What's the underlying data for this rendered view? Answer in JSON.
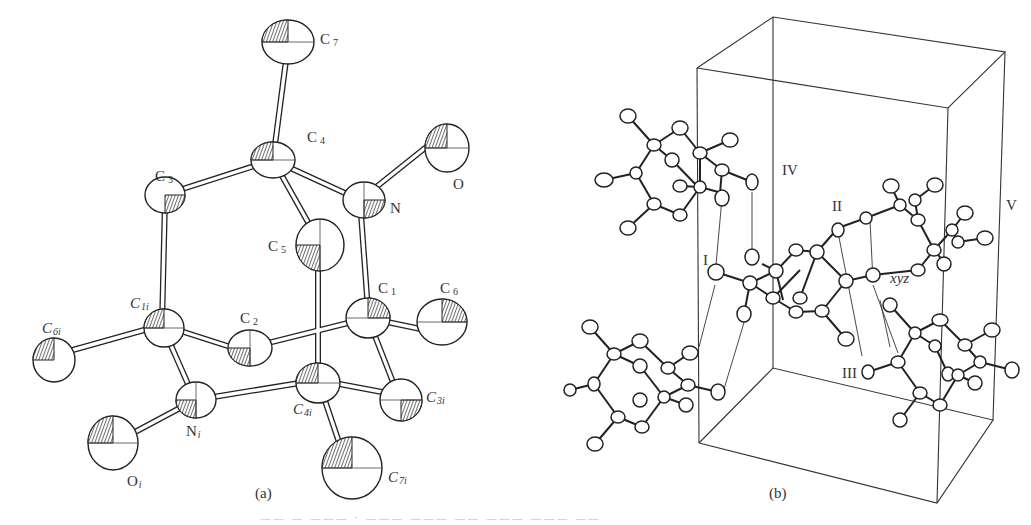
{
  "figure": {
    "panel_a": {
      "label": "(a)",
      "atoms": [
        {
          "id": "C7",
          "text": "C",
          "sub": "7",
          "italic": false
        },
        {
          "id": "C4",
          "text": "C",
          "sub": "4",
          "italic": false
        },
        {
          "id": "C3",
          "text": "C",
          "sub": "3",
          "italic": false
        },
        {
          "id": "N",
          "text": "N",
          "sub": "",
          "italic": false
        },
        {
          "id": "O",
          "text": "O",
          "sub": "",
          "italic": false
        },
        {
          "id": "C5",
          "text": "C",
          "sub": "5",
          "italic": false
        },
        {
          "id": "C1i",
          "text": "C",
          "sub": "1i",
          "italic": true
        },
        {
          "id": "C2",
          "text": "C",
          "sub": "2",
          "italic": false
        },
        {
          "id": "C1",
          "text": "C",
          "sub": "1",
          "italic": false
        },
        {
          "id": "C6",
          "text": "C",
          "sub": "6",
          "italic": false
        },
        {
          "id": "C6i",
          "text": "C",
          "sub": "6i",
          "italic": true
        },
        {
          "id": "Ni",
          "text": "N",
          "sub": "i",
          "italic": false
        },
        {
          "id": "C4i",
          "text": "C",
          "sub": "4i",
          "italic": true
        },
        {
          "id": "C3i",
          "text": "C",
          "sub": "3i",
          "italic": true
        },
        {
          "id": "Oi",
          "text": "O",
          "sub": "i",
          "italic": false
        },
        {
          "id": "C7i",
          "text": "C",
          "sub": "7i",
          "italic": true
        }
      ]
    },
    "panel_b": {
      "label": "(b)",
      "molecule_labels": [
        "I",
        "II",
        "III",
        "IV",
        "V"
      ],
      "position_label": "xyz"
    },
    "caption": "—— — ——— · ——— ——— —— ——— ——— ——"
  }
}
